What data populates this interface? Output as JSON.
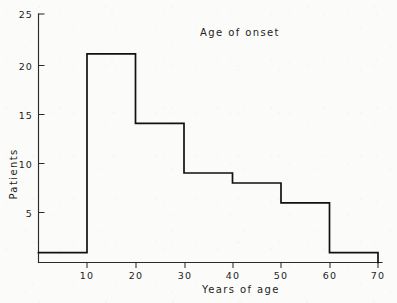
{
  "chart_data": {
    "type": "bar",
    "title": "Age of onset",
    "xlabel": "Years of age",
    "ylabel": "Patients",
    "style": "step-histogram",
    "grid": false,
    "legend": null,
    "xlim": [
      0,
      70
    ],
    "ylim": [
      0,
      25
    ],
    "bin_width": 10,
    "bin_edges": [
      0,
      10,
      20,
      30,
      40,
      50,
      60,
      70
    ],
    "categories": [
      "0-10",
      "10-20",
      "20-30",
      "30-40",
      "40-50",
      "50-60",
      "60-70"
    ],
    "values": [
      1,
      21,
      14,
      9,
      8,
      6,
      1
    ],
    "xticks": [
      0,
      10,
      20,
      30,
      40,
      50,
      60,
      70
    ],
    "xtick_labels": [
      "",
      "10",
      "20",
      "30",
      "40",
      "50",
      "60",
      "70"
    ],
    "yticks": [
      0,
      5,
      10,
      15,
      20,
      25
    ],
    "ytick_labels": [
      "",
      "5",
      "10",
      "15",
      "20",
      "25"
    ],
    "line_color": "#111111",
    "axis_color": "#2b2b2b",
    "background_color": "#fbfbf9"
  },
  "axes": {
    "y_labels": [
      {
        "value": 25,
        "text": "25"
      },
      {
        "value": 20,
        "text": "20"
      },
      {
        "value": 15,
        "text": "15"
      },
      {
        "value": 10,
        "text": "10"
      },
      {
        "value": 5,
        "text": "5"
      }
    ],
    "x_labels": [
      {
        "value": 10,
        "text": "10"
      },
      {
        "value": 20,
        "text": "20"
      },
      {
        "value": 30,
        "text": "30"
      },
      {
        "value": 40,
        "text": "40"
      },
      {
        "value": 50,
        "text": "50"
      },
      {
        "value": 60,
        "text": "60"
      },
      {
        "value": 70,
        "text": "70"
      }
    ]
  }
}
